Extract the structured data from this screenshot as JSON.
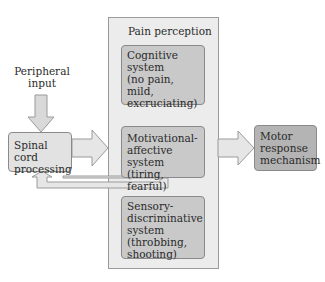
{
  "diagram": {
    "input": {
      "label_line1": "Peripheral",
      "label_line2": "input"
    },
    "spinal": {
      "line1": "Spinal cord",
      "line2": "processing"
    },
    "panel": {
      "title": "Pain perception"
    },
    "cognitive": {
      "line1": "Cognitive",
      "line2": "system",
      "line3": "(no pain, mild,",
      "line4": "excruciating)"
    },
    "motivational": {
      "line1": "Motivational-",
      "line2": "affective system",
      "line3": "(tiring, fearful)"
    },
    "sensory": {
      "line1": "Sensory-",
      "line2": "discriminative",
      "line3": "system",
      "line4": "(throbbing,",
      "line5": "shooting)"
    },
    "motor": {
      "line1": "Motor",
      "line2": "response",
      "line3": "mechanism"
    },
    "colors": {
      "panel": "#ececec",
      "arrow_fill": "#e0e0e0",
      "arrow_stroke": "#9a9a9a",
      "box_mid": "#c9c9c9",
      "box_dark": "#b4b4b4"
    }
  }
}
